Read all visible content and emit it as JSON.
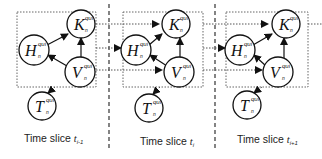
{
  "diagram": {
    "slices": [
      {
        "caption": "Time slice ",
        "caption_sub": "t",
        "caption_index": "i-1"
      },
      {
        "caption": "Time slice ",
        "caption_sub": "t",
        "caption_index": "i"
      },
      {
        "caption": "Time slice ",
        "caption_sub": "t",
        "caption_index": "i+1"
      }
    ],
    "nodes": {
      "K": {
        "letter": "K",
        "sup": "qui",
        "sub": "n"
      },
      "H": {
        "letter": "H",
        "sup": "qui",
        "sub": "n"
      },
      "V": {
        "letter": "V",
        "sup": "qui",
        "sub": "n"
      },
      "T": {
        "letter": "T",
        "sup": "qui",
        "sub": "n"
      }
    },
    "intra_slice_edges": [
      {
        "from": "H",
        "to": "K",
        "style": "solid"
      },
      {
        "from": "V",
        "to": "K",
        "style": "solid"
      },
      {
        "from": "V",
        "to": "H",
        "style": "solid"
      },
      {
        "from": "box",
        "to": "T",
        "style": "dotted"
      }
    ],
    "inter_slice_edges": [
      {
        "from": "K",
        "to": "K(next)",
        "style": "dotted"
      },
      {
        "from": "H",
        "to": "H(next)",
        "style": "dotted"
      },
      {
        "from": "V",
        "to": "V(next)",
        "style": "dotted"
      }
    ],
    "colors": {
      "stroke": "#111111",
      "dotted": "#555555",
      "background": "#ffffff"
    }
  }
}
